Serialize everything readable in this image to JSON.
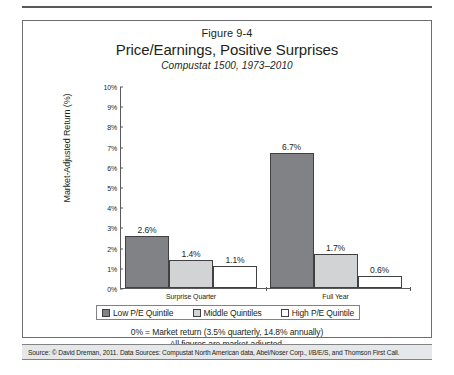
{
  "figure": {
    "number": "Figure 9-4",
    "title": "Price/Earnings, Positive Surprises",
    "subtitle": "Compustat 1500, 1973–2010"
  },
  "notes": {
    "line1": "0% = Market return (3.5% quarterly, 14.8% annually)",
    "line2": "All figures are market-adjusted."
  },
  "source": {
    "text": "Source: © David Dreman, 2011. Data Sources: Compustat North American data, Abel/Noser Corp., I/B/E/S, and Thomson First Call."
  },
  "colors": {
    "low_pe": "#808285",
    "middle": "#d1d3d4",
    "high_pe": "#ffffff",
    "outline": "#414042",
    "axis": "#58595b",
    "source_band": "#e6e7e8"
  },
  "chart_data": {
    "type": "bar",
    "title": "Price/Earnings, Positive Surprises",
    "subtitle": "Compustat 1500, 1973–2010",
    "xlabel": "",
    "ylabel": "Market-Adjusted Return (%)",
    "ylim": [
      0,
      10
    ],
    "ytick_labels": [
      "10%",
      "9%",
      "8%",
      "7%",
      "6%",
      "5%",
      "4%",
      "3%",
      "2%",
      "1%",
      "0%"
    ],
    "ytick_values": [
      10,
      9,
      8,
      7,
      6,
      5,
      4,
      3,
      2,
      1,
      0
    ],
    "grid": false,
    "legend_position": "below-plot",
    "categories": [
      "Surprise Quarter",
      "Full Year"
    ],
    "series": [
      {
        "name": "Low P/E Quintile",
        "color": "#808285",
        "values": [
          2.6,
          6.7
        ],
        "labels": [
          "2.6%",
          "6.7%"
        ]
      },
      {
        "name": "Middle Quintiles",
        "color": "#d1d3d4",
        "values": [
          1.4,
          1.7
        ],
        "labels": [
          "1.4%",
          "1.7%"
        ]
      },
      {
        "name": "High P/E Quintile",
        "color": "#ffffff",
        "values": [
          1.1,
          0.6
        ],
        "labels": [
          "1.1%",
          "0.6%"
        ]
      }
    ],
    "annotations": [
      "0% = Market return (3.5% quarterly, 14.8% annually)",
      "All figures are market-adjusted."
    ]
  }
}
